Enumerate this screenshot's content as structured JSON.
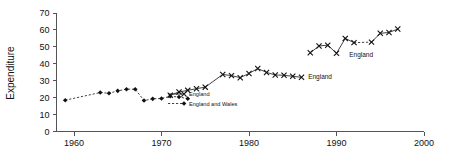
{
  "chart_data": {
    "type": "line",
    "title": "",
    "xlabel": "",
    "ylabel": "Expenditure",
    "xlim": [
      1958,
      2000
    ],
    "ylim": [
      0,
      70
    ],
    "grid": false,
    "legend_position": "inside-center-left",
    "xticks": [
      "1960",
      "1970",
      "1980",
      "1990",
      "2000"
    ],
    "xtick_values": [
      1960,
      1970,
      1980,
      1990,
      2000
    ],
    "yticks": [
      "0",
      "10",
      "20",
      "30",
      "40",
      "50",
      "60",
      "70"
    ],
    "ytick_values": [
      0,
      10,
      20,
      30,
      40,
      50,
      60,
      70
    ],
    "series": [
      {
        "name": "England and Wales",
        "marker": "diamond",
        "linestyle": "dashed",
        "x": [
          1959,
          1963,
          1964,
          1965,
          1966,
          1967,
          1968,
          1969,
          1970,
          1971,
          1972,
          1973
        ],
        "values": [
          18.5,
          23.0,
          22.6,
          24.0,
          25.0,
          25.0,
          18.3,
          19.3,
          19.5,
          20.8,
          20.4,
          19.4
        ]
      },
      {
        "name": "England",
        "marker": "x",
        "linestyle": "solid",
        "x": [
          1971,
          1972,
          1973,
          1974,
          1975,
          1977,
          1978,
          1979,
          1980,
          1981,
          1982,
          1983,
          1984,
          1985,
          1986
        ],
        "values": [
          21.4,
          23.4,
          24.3,
          25.3,
          26.2,
          33.7,
          33.0,
          31.8,
          34.3,
          37.2,
          34.9,
          33.4,
          33.2,
          32.6,
          32.0
        ]
      },
      {
        "name": "England",
        "marker": "x",
        "linestyle": "solid-with-gap",
        "x": [
          1987,
          1988,
          1989,
          1990,
          1991,
          1992,
          1994,
          1995,
          1996,
          1997
        ],
        "values": [
          46.5,
          50.5,
          51.0,
          46.2,
          55.0,
          52.5,
          52.8,
          58.0,
          58.5,
          60.5
        ]
      }
    ],
    "annotations": [
      {
        "text": "England",
        "x": 1986.3,
        "y": 32.4,
        "series": "England"
      },
      {
        "text": "England",
        "x": 1991.0,
        "y": 45.5,
        "series": "England"
      }
    ],
    "legend_entries": [
      {
        "label": "England",
        "marker": "x",
        "linestyle": "solid"
      },
      {
        "label": "England and Wales",
        "marker": "diamond",
        "linestyle": "dashed"
      }
    ],
    "colors": {
      "series": "#111111",
      "axis": "#555555",
      "background": "#ffffff"
    }
  }
}
